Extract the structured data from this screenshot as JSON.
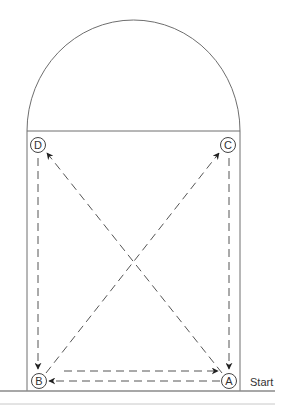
{
  "diagram": {
    "type": "movement-drill",
    "colors": {
      "line": "#6e6e6e",
      "dash": "#555555",
      "base": "#8a8a8a",
      "text": "#333333",
      "background": "#ffffff"
    },
    "nodes": [
      {
        "id": "A",
        "label": "A",
        "x": 229,
        "y": 381
      },
      {
        "id": "B",
        "label": "B",
        "x": 39,
        "y": 381
      },
      {
        "id": "C",
        "label": "C",
        "x": 228,
        "y": 145
      },
      {
        "id": "D",
        "label": "D",
        "x": 38,
        "y": 145
      }
    ],
    "paths": [
      {
        "from": "A",
        "to": "B",
        "style": "dashed",
        "arrow": "end"
      },
      {
        "from": "B",
        "to": "C",
        "style": "dashed",
        "arrow": "end"
      },
      {
        "from": "C",
        "to": "A",
        "style": "dashed",
        "arrow": "end"
      },
      {
        "from": "A",
        "to": "D",
        "style": "dashed",
        "arrow": "end"
      },
      {
        "from": "D",
        "to": "B",
        "style": "dashed",
        "arrow": "end"
      },
      {
        "from": "B",
        "to": "A",
        "style": "dashed",
        "arrow": "end"
      }
    ],
    "start_label": "Start"
  }
}
